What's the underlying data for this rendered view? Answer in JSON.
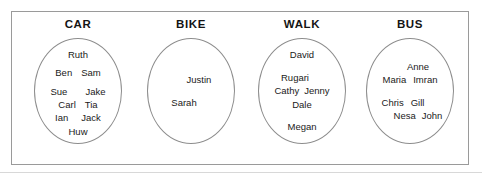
{
  "diagram": {
    "title_text": "",
    "frame": {
      "border_color": "#9a9a9a"
    },
    "groups": [
      {
        "id": "car",
        "label": "CAR",
        "rows": [
          {
            "cells": [
              "Ruth"
            ]
          },
          {
            "cells": [
              "Ben",
              "Sam"
            ]
          },
          {
            "cells": [
              "Sue",
              "Jake"
            ]
          },
          {
            "cells": [
              "Carl",
              "Tia"
            ]
          },
          {
            "cells": [
              "Ian",
              "Jack"
            ]
          },
          {
            "cells": [
              "Huw"
            ]
          }
        ],
        "members": [
          "Ruth",
          "Ben",
          "Sam",
          "Sue",
          "Jake",
          "Carl",
          "Tia",
          "Ian",
          "Jack",
          "Huw"
        ],
        "count": 10
      },
      {
        "id": "bike",
        "label": "BIKE",
        "rows": [
          {
            "cells": [
              "Justin"
            ]
          },
          {
            "cells": [
              "Sarah"
            ]
          }
        ],
        "members": [
          "Justin",
          "Sarah"
        ],
        "count": 2
      },
      {
        "id": "walk",
        "label": "WALK",
        "rows": [
          {
            "cells": [
              "David"
            ]
          },
          {
            "cells": [
              "Rugari"
            ]
          },
          {
            "cells": [
              "Cathy",
              "Jenny"
            ]
          },
          {
            "cells": [
              "Dale"
            ]
          },
          {
            "cells": [
              "Megan"
            ]
          }
        ],
        "members": [
          "David",
          "Rugari",
          "Cathy",
          "Jenny",
          "Dale",
          "Megan"
        ],
        "count": 6
      },
      {
        "id": "bus",
        "label": "BUS",
        "rows": [
          {
            "cells": [
              "Anne"
            ]
          },
          {
            "cells": [
              "Maria",
              "Imran"
            ]
          },
          {
            "cells": [
              "Chris",
              "Gill"
            ]
          },
          {
            "cells": [
              "Nesa",
              "John"
            ]
          }
        ],
        "members": [
          "Anne",
          "Maria",
          "Imran",
          "Chris",
          "Gill",
          "Nesa",
          "John"
        ],
        "count": 7
      }
    ]
  }
}
